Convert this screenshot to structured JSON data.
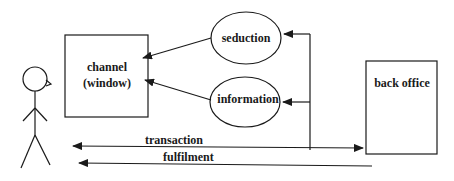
{
  "diagram": {
    "nodes": {
      "channel": {
        "line1": "channel",
        "line2": "(window)"
      },
      "seduction": {
        "label": "seduction"
      },
      "information": {
        "label": "information"
      },
      "back_office": {
        "label": "back office"
      },
      "customer": {
        "label": ""
      }
    },
    "edges": {
      "transaction": {
        "label": "transaction"
      },
      "fulfilment": {
        "label": "fulfilment"
      }
    },
    "colors": {
      "stroke": "#1a1a1a",
      "background": "#ffffff"
    }
  }
}
